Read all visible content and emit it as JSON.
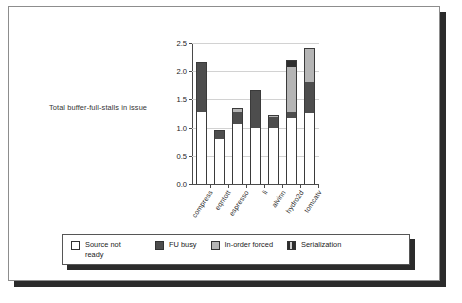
{
  "chart_data": {
    "type": "bar",
    "title": "",
    "subtitle": "",
    "xlabel": "",
    "ylabel": "Total buffer-full-stalls in issue",
    "ylim": [
      0.0,
      2.5
    ],
    "ytick_labels": [
      "0.0",
      "0.5",
      "1.0",
      "1.5",
      "2.0",
      "2.5"
    ],
    "ytick_values": [
      0.0,
      0.5,
      1.0,
      1.5,
      2.0,
      2.5
    ],
    "grid": true,
    "stacked": true,
    "legend_position": "bottom",
    "categories": [
      "compress",
      "eqntott",
      "espresso",
      "li",
      "alvinn",
      "hydro2d",
      "tomcatv"
    ],
    "series": [
      {
        "name": "Source not ready",
        "color": "#ffffff",
        "values": [
          1.28,
          0.79,
          1.06,
          1.0,
          0.99,
          1.17,
          1.26
        ]
      },
      {
        "name": "FU busy",
        "color": "#4d4d4d",
        "values": [
          0.89,
          0.16,
          0.22,
          0.67,
          0.19,
          0.1,
          0.54
        ]
      },
      {
        "name": "In-order forced",
        "color": "#b5b5b5",
        "values": [
          0.0,
          0.0,
          0.06,
          0.0,
          0.04,
          0.8,
          0.62
        ]
      },
      {
        "name": "Serialization",
        "color": "#2e2e2e",
        "values": [
          0.0,
          0.0,
          0.0,
          0.0,
          0.0,
          0.13,
          0.0
        ]
      }
    ],
    "totals": [
      2.17,
      0.95,
      1.34,
      1.67,
      1.22,
      2.2,
      2.42
    ]
  },
  "legend": {
    "items": [
      {
        "label": "Source not ready",
        "swatch": "source-not-ready-swatch"
      },
      {
        "label": "FU busy",
        "swatch": "fu-busy-swatch"
      },
      {
        "label": "In-order forced",
        "swatch": "in-order-forced-swatch"
      },
      {
        "label": "Serialization",
        "swatch": "serialization-swatch"
      }
    ]
  }
}
